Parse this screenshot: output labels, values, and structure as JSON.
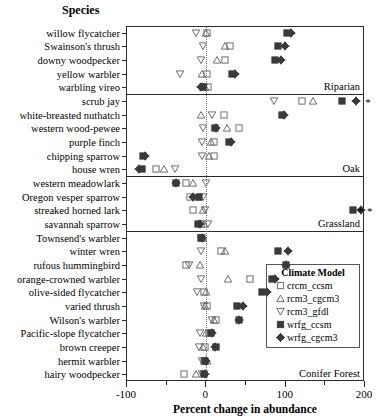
{
  "title": "Species",
  "legend": {
    "title": "Climate Model",
    "position": "inside-right-lower",
    "entries": [
      {
        "name": "crcm_ccsm",
        "marker": "open-square"
      },
      {
        "name": "rcm3_cgcm3",
        "marker": "open-triangle-up"
      },
      {
        "name": "rcm3_gfdl",
        "marker": "open-triangle-down"
      },
      {
        "name": "wrfg_ccsm",
        "marker": "filled-square"
      },
      {
        "name": "wrfg_cgcm3",
        "marker": "filled-diamond-crossed"
      }
    ]
  },
  "chart_data": {
    "type": "scatter",
    "title": "",
    "xlabel": "Percent change in abundance",
    "ylabel": "Species",
    "xlim": [
      -100,
      200
    ],
    "xticks": [
      -100,
      -50,
      0,
      50,
      100,
      150,
      200
    ],
    "xticklabels": [
      "-100",
      "",
      "0",
      "",
      "100",
      "",
      "200"
    ],
    "grid": false,
    "zero_reference_line": 0,
    "series": [
      {
        "name": "crcm_ccsm",
        "marker": "open-square"
      },
      {
        "name": "rcm3_cgcm3",
        "marker": "open-triangle-up"
      },
      {
        "name": "rcm3_gfdl",
        "marker": "open-triangle-down"
      },
      {
        "name": "wrfg_ccsm",
        "marker": "filled-square"
      },
      {
        "name": "wrfg_cgcm3",
        "marker": "filled-diamond-crossed"
      }
    ],
    "panels": [
      {
        "label": "Riparian",
        "rows": [
          {
            "species": "willow flycatcher",
            "values": {
              "crcm_ccsm": 2,
              "rcm3_cgcm3": 1,
              "rcm3_gfdl": -12,
              "wrfg_ccsm": 103,
              "wrfg_cgcm3": 108
            }
          },
          {
            "species": "Swainson's thrush",
            "values": {
              "crcm_ccsm": 31,
              "rcm3_cgcm3": 25,
              "rcm3_gfdl": -3,
              "wrfg_ccsm": 92,
              "wrfg_cgcm3": 101
            }
          },
          {
            "species": "downy woodpecker",
            "values": {
              "crcm_ccsm": 25,
              "rcm3_cgcm3": 15,
              "rcm3_gfdl": -5,
              "wrfg_ccsm": 88,
              "wrfg_cgcm3": 95
            }
          },
          {
            "species": "yellow warbler",
            "values": {
              "crcm_ccsm": 2,
              "rcm3_cgcm3": -4,
              "rcm3_gfdl": -32,
              "wrfg_ccsm": 33,
              "wrfg_cgcm3": 37
            }
          },
          {
            "species": "warbling vireo",
            "values": {
              "crcm_ccsm": 3,
              "rcm3_cgcm3": -1,
              "rcm3_gfdl": -2,
              "wrfg_ccsm": -3,
              "wrfg_cgcm3": -6
            }
          }
        ]
      },
      {
        "label": "Oak",
        "rows": [
          {
            "species": "scrub jay",
            "values": {
              "crcm_ccsm": 122,
              "rcm3_cgcm3": 136,
              "rcm3_gfdl": 86,
              "wrfg_ccsm": 172,
              "wrfg_cgcm3": 190
            }
          },
          {
            "species": "white-breasted nuthatch",
            "values": {
              "crcm_ccsm": 23,
              "rcm3_cgcm3": -6,
              "rcm3_gfdl": 9,
              "wrfg_ccsm": 97,
              "wrfg_cgcm3": 99
            }
          },
          {
            "species": "western wood-pewee",
            "values": {
              "crcm_ccsm": 42,
              "rcm3_cgcm3": 27,
              "rcm3_gfdl": -3,
              "wrfg_ccsm": 12,
              "wrfg_cgcm3": 13
            }
          },
          {
            "species": "purple finch",
            "values": {
              "crcm_ccsm": 11,
              "rcm3_cgcm3": 7,
              "rcm3_gfdl": -4,
              "wrfg_ccsm": 30,
              "wrfg_cgcm3": 32
            }
          },
          {
            "species": "chipping sparrow",
            "values": {
              "crcm_ccsm": 11,
              "rcm3_cgcm3": 4,
              "rcm3_gfdl": -4,
              "wrfg_ccsm": -79,
              "wrfg_cgcm3": -76
            }
          },
          {
            "species": "house wren",
            "values": {
              "crcm_ccsm": -62,
              "rcm3_cgcm3": -52,
              "rcm3_gfdl": -38,
              "wrfg_ccsm": -80,
              "wrfg_cgcm3": -84
            }
          }
        ]
      },
      {
        "label": "Grassland",
        "rows": [
          {
            "species": "western meadowlark",
            "values": {
              "crcm_ccsm": -25,
              "rcm3_cgcm3": -16,
              "rcm3_gfdl": 1,
              "wrfg_ccsm": -37,
              "wrfg_cgcm3": -37
            }
          },
          {
            "species": "Oregon vesper sparrow",
            "values": {
              "crcm_ccsm": -19,
              "rcm3_cgcm3": -9,
              "rcm3_gfdl": -3,
              "wrfg_ccsm": -8,
              "wrfg_cgcm3": -15
            }
          },
          {
            "species": "streaked horned lark",
            "values": {
              "crcm_ccsm": -16,
              "rcm3_cgcm3": -3,
              "rcm3_gfdl": 0,
              "wrfg_ccsm": 186,
              "wrfg_cgcm3": 196
            }
          },
          {
            "species": "savannah sparrow",
            "values": {
              "crcm_ccsm": -6,
              "rcm3_cgcm3": -2,
              "rcm3_gfdl": 3,
              "wrfg_ccsm": -9,
              "wrfg_cgcm3": -7
            }
          }
        ]
      },
      {
        "label": "Conifer Forest",
        "rows": [
          {
            "species": "Townsend's warbler",
            "values": {
              "crcm_ccsm": -4,
              "rcm3_cgcm3": -3,
              "rcm3_gfdl": -6,
              "wrfg_ccsm": -5,
              "wrfg_cgcm3": -4
            }
          },
          {
            "species": "winter wren",
            "values": {
              "crcm_ccsm": 20,
              "rcm3_cgcm3": 25,
              "rcm3_gfdl": -6,
              "wrfg_ccsm": 91,
              "wrfg_cgcm3": 104
            }
          },
          {
            "species": "rufous hummingbird",
            "values": {
              "crcm_ccsm": -24,
              "rcm3_cgcm3": -7,
              "rcm3_gfdl": -20,
              "wrfg_ccsm": 102,
              "wrfg_cgcm3": 102
            }
          },
          {
            "species": "orange-crowned warbler",
            "values": {
              "crcm_ccsm": 56,
              "rcm3_cgcm3": 28,
              "rcm3_gfdl": -6,
              "wrfg_ccsm": 84,
              "wrfg_cgcm3": 88
            }
          },
          {
            "species": "olive-sided flycatcher",
            "values": {
              "crcm_ccsm": -2,
              "rcm3_cgcm3": 1,
              "rcm3_gfdl": -10,
              "wrfg_ccsm": 72,
              "wrfg_cgcm3": 78
            }
          },
          {
            "species": "varied thrush",
            "values": {
              "crcm_ccsm": 2,
              "rcm3_cgcm3": 0,
              "rcm3_gfdl": -2,
              "wrfg_ccsm": 40,
              "wrfg_cgcm3": 48
            }
          },
          {
            "species": "Wilson's warbler",
            "values": {
              "crcm_ccsm": 13,
              "rcm3_cgcm3": 11,
              "rcm3_gfdl": 8,
              "wrfg_ccsm": 42,
              "wrfg_cgcm3": 43
            }
          },
          {
            "species": "Pacific-slope flycatcher",
            "values": {
              "crcm_ccsm": 4,
              "rcm3_cgcm3": 1,
              "rcm3_gfdl": -7,
              "wrfg_ccsm": 7,
              "wrfg_cgcm3": 8
            }
          },
          {
            "species": "brown creeper",
            "values": {
              "crcm_ccsm": -1,
              "rcm3_cgcm3": -3,
              "rcm3_gfdl": -8,
              "wrfg_ccsm": 13,
              "wrfg_cgcm3": 12
            }
          },
          {
            "species": "hermit warbler",
            "values": {
              "crcm_ccsm": -2,
              "rcm3_cgcm3": 2,
              "rcm3_gfdl": -4,
              "wrfg_ccsm": -1,
              "wrfg_cgcm3": 1
            }
          },
          {
            "species": "hairy woodpecker",
            "values": {
              "crcm_ccsm": -27,
              "rcm3_cgcm3": -12,
              "rcm3_gfdl": -4,
              "wrfg_ccsm": -2,
              "wrfg_cgcm3": -1
            }
          }
        ]
      }
    ],
    "annotations": [
      {
        "species": "scrub jay",
        "symbol": "*",
        "value": 205,
        "count": 1
      },
      {
        "species": "streaked horned lark",
        "symbol": "*",
        "value": 196,
        "count": 2
      }
    ]
  }
}
